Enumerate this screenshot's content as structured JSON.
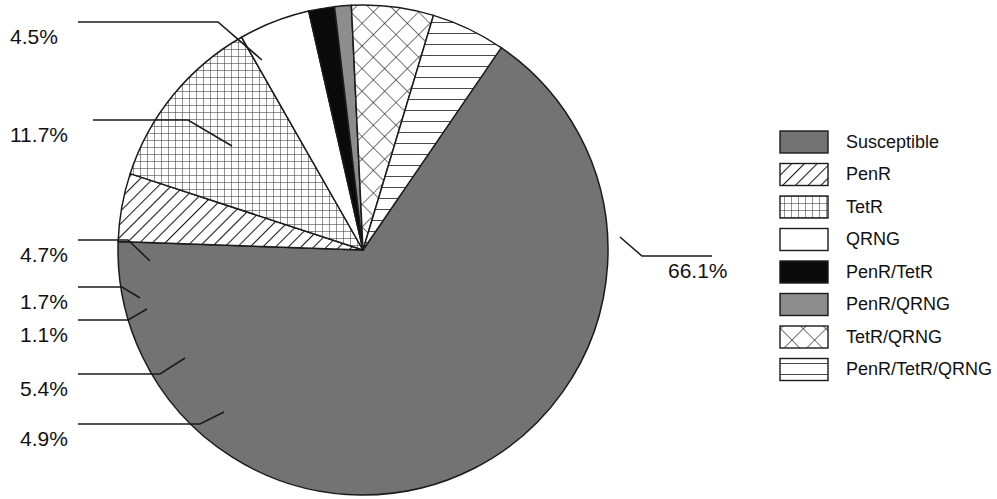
{
  "chart_data": {
    "type": "pie",
    "title": "",
    "subtitle": "",
    "xlabel": "",
    "ylabel": "",
    "legend_position": "right",
    "grid": false,
    "units": "percent",
    "total": 101.1,
    "categories": [
      "Susceptible",
      "PenR",
      "TetR",
      "QRNG",
      "PenR/TetR",
      "PenR/QRNG",
      "TetR/QRNG",
      "PenR/TetR/QRNG"
    ],
    "values": [
      66.1,
      4.5,
      11.7,
      4.7,
      1.7,
      1.1,
      5.4,
      4.9
    ],
    "labels": [
      "66.1%",
      "4.5%",
      "11.7%",
      "4.7%",
      "1.7%",
      "1.1%",
      "5.4%",
      "4.9%"
    ],
    "slices": [
      {
        "name": "Susceptible",
        "value": 66.1,
        "label": "66.1%",
        "pattern": "solid-gray",
        "fill": "#737373",
        "start_angle": -56.0,
        "end_angle": 181.96
      },
      {
        "name": "PenR",
        "value": 4.5,
        "label": "4.5%",
        "pattern": "diagonal-hatch",
        "fill": "#ffffff",
        "start_angle": 181.96,
        "end_angle": 198.16
      },
      {
        "name": "TetR",
        "value": 11.7,
        "label": "11.7%",
        "pattern": "fine-grid",
        "fill": "#ffffff",
        "start_angle": 198.16,
        "end_angle": 240.28
      },
      {
        "name": "QRNG",
        "value": 4.7,
        "label": "4.7%",
        "pattern": "blank-white",
        "fill": "#ffffff",
        "start_angle": 240.28,
        "end_angle": 257.2
      },
      {
        "name": "PenR/TetR",
        "value": 1.7,
        "label": "1.7%",
        "pattern": "solid-black",
        "fill": "#0a0a0a",
        "start_angle": 257.2,
        "end_angle": 263.32
      },
      {
        "name": "PenR/QRNG",
        "value": 1.1,
        "label": "1.1%",
        "pattern": "solid-midgray",
        "fill": "#8d8d8d",
        "start_angle": 263.32,
        "end_angle": 267.28
      },
      {
        "name": "TetR/QRNG",
        "value": 5.4,
        "label": "5.4%",
        "pattern": "diagonal-crosshatch",
        "fill": "#ffffff",
        "start_angle": 267.28,
        "end_angle": 286.72
      },
      {
        "name": "PenR/TetR/QRNG",
        "value": 4.9,
        "label": "4.9%",
        "pattern": "horizontal-lines",
        "fill": "#ffffff",
        "start_angle": 286.72,
        "end_angle": 304.36
      }
    ],
    "colors": {
      "susceptible_gray": "#737373",
      "penr_qrng_gray": "#8d8d8d",
      "penr_tetr_black": "#0a0a0a",
      "outline": "#1b1b1b",
      "background": "#ffffff",
      "text": "#111111"
    }
  },
  "callouts": [
    {
      "id": "callout-penr",
      "text": "4.5%",
      "x": 10,
      "y": 29
    },
    {
      "id": "callout-tetr",
      "text": "11.7%",
      "x": 10,
      "y": 127
    },
    {
      "id": "callout-qrng",
      "text": "4.7%",
      "x": 20,
      "y": 247
    },
    {
      "id": "callout-penr-tetr",
      "text": "1.7%",
      "x": 20,
      "y": 294
    },
    {
      "id": "callout-penr-qrng",
      "text": "1.1%",
      "x": 20,
      "y": 327
    },
    {
      "id": "callout-tetr-qrng",
      "text": "5.4%",
      "x": 20,
      "y": 381
    },
    {
      "id": "callout-penr-tetr-qrng",
      "text": "4.9%",
      "x": 20,
      "y": 431
    },
    {
      "id": "callout-susceptible",
      "text": "66.1%",
      "x": 668,
      "y": 263
    }
  ],
  "legend": {
    "title": "",
    "items": [
      {
        "label": "Susceptible",
        "pattern": "solid-gray"
      },
      {
        "label": "PenR",
        "pattern": "diagonal-hatch"
      },
      {
        "label": "TetR",
        "pattern": "fine-grid"
      },
      {
        "label": "QRNG",
        "pattern": "blank-white"
      },
      {
        "label": "PenR/TetR",
        "pattern": "solid-black"
      },
      {
        "label": "PenR/QRNG",
        "pattern": "solid-midgray"
      },
      {
        "label": "TetR/QRNG",
        "pattern": "diagonal-crosshatch"
      },
      {
        "label": "PenR/TetR/QRNG",
        "pattern": "horizontal-lines"
      }
    ]
  }
}
